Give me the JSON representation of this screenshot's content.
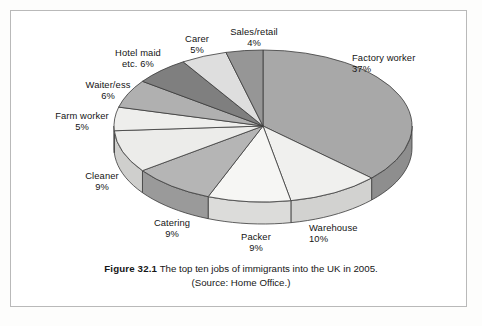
{
  "figure": {
    "caption_bold": "Figure 32.1",
    "caption_text": "The top ten jobs of immigrants into the UK in 2005.",
    "caption_source": "(Source: Home Office.)"
  },
  "chart_data": {
    "type": "pie",
    "title": "The top ten jobs of immigrants into the UK in 2005",
    "subtitle": "(Source: Home Office.)",
    "units": "percent",
    "labels_show_percent": true,
    "legend": "none",
    "grid": false,
    "three_d": true,
    "start_angle_deg": 0,
    "direction": "clockwise",
    "total": 100,
    "categories": [
      "Factory worker",
      "Warehouse",
      "Packer",
      "Catering",
      "Cleaner",
      "Farm worker",
      "Waiter/ess",
      "Hotel maid etc.",
      "Carer",
      "Sales/retail"
    ],
    "values": [
      37,
      10,
      9,
      9,
      9,
      5,
      6,
      6,
      5,
      4
    ],
    "slices": [
      {
        "label": "Factory worker",
        "value": 37,
        "percent_text": "37%",
        "color": "#a8a8a8",
        "side_color": "#8e8e8e"
      },
      {
        "label": "Warehouse",
        "value": 10,
        "percent_text": "10%",
        "color": "#f0f0ee",
        "side_color": "#d2d2d0"
      },
      {
        "label": "Packer",
        "value": 9,
        "percent_text": "9%",
        "color": "#f6f6f4",
        "side_color": "#dcdcda"
      },
      {
        "label": "Catering",
        "value": 9,
        "percent_text": "9%",
        "color": "#b5b5b5",
        "side_color": "#9a9a9a"
      },
      {
        "label": "Cleaner",
        "value": 9,
        "percent_text": "9%",
        "color": "#ececea",
        "side_color": "#cfcfcd"
      },
      {
        "label": "Farm worker",
        "value": 5,
        "percent_text": "5%",
        "color": "#eeeeec",
        "side_color": "#d0d0ce"
      },
      {
        "label": "Waiter/ess",
        "value": 6,
        "percent_text": "6%",
        "color": "#b0b0b0",
        "side_color": "#969696"
      },
      {
        "label": "Hotel maid etc.",
        "value": 6,
        "percent_text": "6%",
        "color": "#7f7f7f",
        "side_color": "#6b6b6b"
      },
      {
        "label": "Carer",
        "value": 5,
        "percent_text": "5%",
        "color": "#dedede",
        "side_color": "#c2c2c2"
      },
      {
        "label": "Sales/retail",
        "value": 4,
        "percent_text": "4%",
        "color": "#969696",
        "side_color": "#7f7f7f"
      }
    ]
  },
  "labels": {
    "factory_worker": {
      "name": "Factory worker",
      "pct": "37%"
    },
    "warehouse": {
      "name": "Warehouse",
      "pct": "10%"
    },
    "packer": {
      "name": "Packer",
      "pct": "9%"
    },
    "catering": {
      "name": "Catering",
      "pct": "9%"
    },
    "cleaner": {
      "name": "Cleaner",
      "pct": "9%"
    },
    "farm_worker": {
      "name": "Farm worker",
      "pct": "5%"
    },
    "waiter_ess": {
      "name": "Waiter/ess",
      "pct": "6%"
    },
    "hotel_maid_l1": {
      "name": "Hotel maid",
      "pct": "etc. 6%"
    },
    "carer": {
      "name": "Carer",
      "pct": "5%"
    },
    "sales_retail": {
      "name": "Sales/retail",
      "pct": "4%"
    }
  }
}
